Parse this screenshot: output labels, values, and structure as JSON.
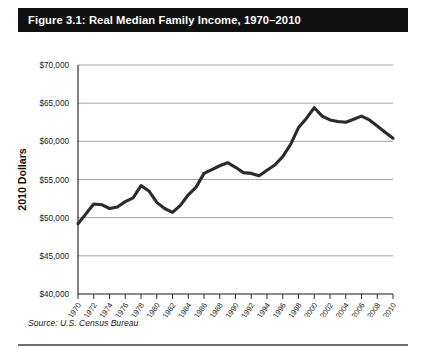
{
  "figure": {
    "title": "Figure 3.1: Real Median Family Income, 1970–2010",
    "source_note": "Source: U.S. Census Bureau",
    "title_bar_color": "#101010",
    "title_text_color": "#ffffff",
    "line_color": "#2b2b2b",
    "grid_color": "#9a9a9a",
    "axis_color": "#1a1a1a",
    "background_color": "#ffffff"
  },
  "chart_data": {
    "type": "line",
    "title": "Figure 3.1: Real Median Family Income, 1970–2010",
    "subtitle": "",
    "xlabel": "",
    "ylabel": "2010 Dollars",
    "ylim": [
      40000,
      70000
    ],
    "xlim": [
      1970,
      2010
    ],
    "grid": true,
    "grid_axis": "y",
    "legend": false,
    "legend_position": "none",
    "ytick_labels": [
      "$40,000",
      "$45,000",
      "$50,000",
      "$55,000",
      "$60,000",
      "$65,000",
      "$70,000"
    ],
    "ytick_values": [
      40000,
      45000,
      50000,
      55000,
      60000,
      65000,
      70000
    ],
    "xtick_labels": [
      "1970",
      "1972",
      "1974",
      "1976",
      "1978",
      "1980",
      "1982",
      "1984",
      "1986",
      "1988",
      "1990",
      "1992",
      "1994",
      "1996",
      "1998",
      "2000",
      "2002",
      "2004",
      "2006",
      "2008",
      "2010"
    ],
    "xtick_values": [
      1970,
      1972,
      1974,
      1976,
      1978,
      1980,
      1982,
      1984,
      1986,
      1988,
      1990,
      1992,
      1994,
      1996,
      1998,
      2000,
      2002,
      2004,
      2006,
      2008,
      2010
    ],
    "x": [
      1970,
      1971,
      1972,
      1973,
      1974,
      1975,
      1976,
      1977,
      1978,
      1979,
      1980,
      1981,
      1982,
      1983,
      1984,
      1985,
      1986,
      1987,
      1988,
      1989,
      1990,
      1991,
      1992,
      1993,
      1994,
      1995,
      1996,
      1997,
      1998,
      1999,
      2000,
      2001,
      2002,
      2003,
      2004,
      2005,
      2006,
      2007,
      2008,
      2009,
      2010
    ],
    "values": [
      49200,
      50500,
      51800,
      51700,
      51200,
      51400,
      52100,
      52600,
      54200,
      53500,
      52000,
      51200,
      50700,
      51600,
      53000,
      54000,
      55800,
      56300,
      56800,
      57200,
      56600,
      55900,
      55800,
      55500,
      56200,
      56900,
      58000,
      59600,
      61800,
      63000,
      64400,
      63300,
      62800,
      62600,
      62500,
      62900,
      63300,
      62800,
      62000,
      61200,
      60400
    ],
    "series": [
      {
        "name": "Real median family income",
        "units": "2010 Dollars",
        "color": "#2b2b2b",
        "values": [
          49200,
          50500,
          51800,
          51700,
          51200,
          51400,
          52100,
          52600,
          54200,
          53500,
          52000,
          51200,
          50700,
          51600,
          53000,
          54000,
          55800,
          56300,
          56800,
          57200,
          56600,
          55900,
          55800,
          55500,
          56200,
          56900,
          58000,
          59600,
          61800,
          63000,
          64400,
          63300,
          62800,
          62600,
          62500,
          62900,
          63300,
          62800,
          62000,
          61200,
          60400
        ]
      }
    ],
    "annotations": []
  }
}
